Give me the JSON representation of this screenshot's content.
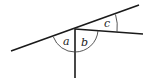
{
  "diagram": {
    "labels": {
      "a": "a",
      "b": "b",
      "c": "c"
    },
    "colors": {
      "line": "#1a1a1a",
      "arc": "#444444",
      "text": "#222222"
    }
  }
}
